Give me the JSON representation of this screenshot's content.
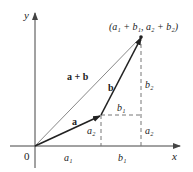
{
  "diagram": {
    "axes": {
      "x_label": "x",
      "y_label": "y",
      "origin_label": "0"
    },
    "vectors": {
      "a": {
        "label": "a"
      },
      "b": {
        "label": "b"
      },
      "sum": {
        "label": "a + b"
      }
    },
    "point_label": "(a₁ + b₁, a₂ + b₂)",
    "component_labels": {
      "a1_axis": "a₁",
      "b1_axis": "b₁",
      "a2_left": "a₂",
      "a2_right": "a₂",
      "b1_mid": "b₁",
      "b2_right": "b₂"
    },
    "colors": {
      "axis": "#444444",
      "vector": "#222222",
      "sum_vector": "#888888",
      "dashed": "#777777"
    }
  }
}
